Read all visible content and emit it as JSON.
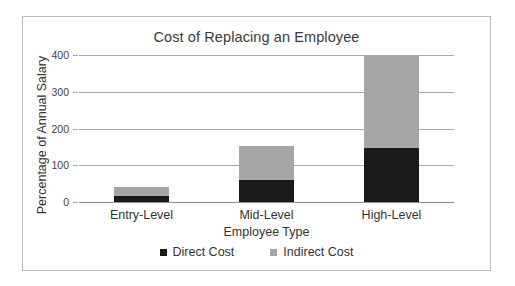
{
  "chart_data": {
    "type": "bar",
    "subtype": "stacked-bar",
    "title": "Cost of Replacing an Employee",
    "xlabel": "Employee Type",
    "ylabel": "Percentage of Annual Salary",
    "categories": [
      "Entry-Level",
      "Mid-Level",
      "High-Level"
    ],
    "series": [
      {
        "name": "Direct Cost",
        "values": [
          16,
          60,
          148
        ],
        "color": "#1a1a1a"
      },
      {
        "name": "Indirect Cost",
        "values": [
          24,
          92,
          252
        ],
        "color": "#a6a6a6"
      }
    ],
    "totals": [
      40,
      152,
      400
    ],
    "ylim": [
      0,
      400
    ],
    "yticks": [
      0,
      100,
      200,
      300,
      400
    ],
    "ytick_labels": [
      "0",
      "100",
      "200",
      "300",
      "400"
    ],
    "grid": true,
    "legend_position": "bottom"
  },
  "legend": {
    "items": [
      {
        "label": "Direct Cost",
        "color": "#1a1a1a"
      },
      {
        "label": "Indirect Cost",
        "color": "#a6a6a6"
      }
    ]
  }
}
